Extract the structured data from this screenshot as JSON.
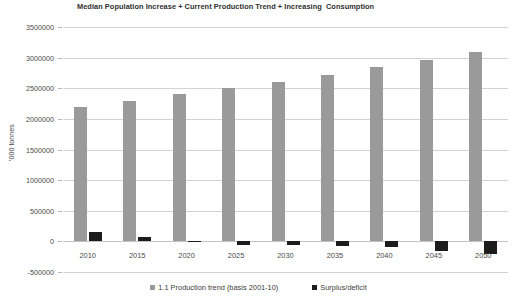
{
  "chart_data": {
    "type": "bar",
    "title": "Median Population Increase + Current Production Trend + Increasing  Consumption",
    "xlabel": "",
    "ylabel": "'000 tonnes",
    "categories": [
      "2010",
      "2015",
      "2020",
      "2025",
      "2030",
      "2035",
      "2040",
      "2045",
      "2050"
    ],
    "series": [
      {
        "name": "1.1 Production trend (basis 2001-10)",
        "color": "#9a9a9a",
        "values": [
          2200000,
          2300000,
          2400000,
          2500000,
          2600000,
          2720000,
          2850000,
          2960000,
          3090000
        ]
      },
      {
        "name": "Surplus/deficit",
        "color": "#1c1c1c",
        "values": [
          150000,
          70000,
          10000,
          -60000,
          -65000,
          -70000,
          -90000,
          -160000,
          -210000
        ]
      }
    ],
    "ylim": [
      -500000,
      3500000
    ],
    "yticks": [
      3500000,
      3000000,
      2500000,
      2000000,
      1500000,
      1000000,
      500000,
      0,
      -500000
    ],
    "ytick_labels": [
      "3500000",
      "3000000",
      "2500000",
      "2000000",
      "1500000",
      "1000000",
      "500000",
      "0",
      "-500000"
    ],
    "grid": true,
    "legend_position": "bottom"
  },
  "legend": {
    "items": [
      {
        "label": "1.1 Production trend (basis 2001-10)",
        "color": "#9a9a9a"
      },
      {
        "label": "Surplus/deficit",
        "color": "#1c1c1c"
      }
    ]
  }
}
